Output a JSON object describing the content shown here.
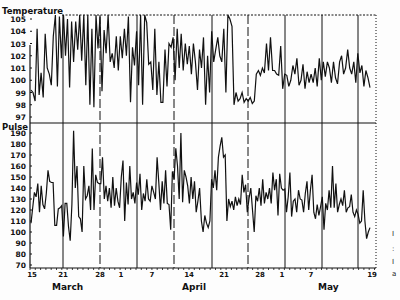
{
  "chart_data": [
    {
      "type": "line",
      "title": "Temperature",
      "ylabel": "Temperature",
      "ylim": [
        97,
        105
      ],
      "yticks": [
        97,
        98,
        99,
        100,
        101,
        102,
        103,
        104,
        105
      ],
      "grid": false,
      "x_labels": [
        "15",
        "21",
        "28",
        "1",
        "7",
        "14",
        "21",
        "28",
        "1",
        "7",
        "19"
      ],
      "months": [
        "March",
        "April",
        "May"
      ],
      "series": [
        {
          "name": "Temperature",
          "values": [
            99.2,
            99.0,
            98.3,
            104.2,
            98.8,
            100.6,
            98.6,
            103.8,
            101,
            100.5,
            99.6,
            103.6,
            105.4,
            99.5,
            105.2,
            101.8,
            105.4,
            102,
            105,
            99.4,
            104.8,
            101.5,
            104.8,
            102.5,
            105.4,
            101.6,
            105.4,
            99.6,
            105.4,
            98.0,
            104.2,
            97.8,
            105.4,
            102.6,
            105.2,
            99.1,
            104.1,
            102.2,
            105.4,
            101.5,
            102.2,
            101.0,
            103.6,
            100.8,
            103.6,
            101.8,
            104.2,
            102.0,
            105.2,
            98.2,
            102.7,
            101.2,
            104.0,
            99.6,
            105.4,
            98.0,
            105.4,
            104.7,
            101.3,
            101.5,
            99.2,
            104.2,
            98.8,
            101.5,
            98.2,
            98.2,
            102.5,
            99.5,
            103,
            102.7,
            103.5,
            100.0,
            104.2,
            101,
            103.8,
            100.8,
            103.0,
            101.3,
            102.8,
            100.5,
            103,
            101.5,
            99.2,
            102.5,
            101.0,
            103.5,
            98.0,
            102.0,
            99.0,
            104.0,
            101.5,
            102.5,
            103.5,
            102,
            101.5,
            104.2,
            99.0,
            105.4,
            105,
            104.4,
            98.0,
            99,
            98.3,
            98.5,
            99,
            98.2,
            98.5,
            98.3,
            98.6,
            98.1,
            98.3,
            100.5,
            100.8,
            100.4,
            101,
            100.6,
            103,
            100.8,
            103.5,
            100.8,
            100.8,
            100.5,
            100.4,
            102.8,
            99.3,
            100.5,
            100.4,
            99.5,
            100,
            101.2,
            100.5,
            101.8,
            99.6,
            100.0,
            101.3,
            99.3,
            100.7,
            99.8,
            100.5,
            99.8,
            101.0,
            99.5,
            101.8,
            100.0,
            101.5,
            100.3,
            101.5,
            101.0,
            99.8,
            101.5,
            100.2,
            99.7,
            101.5,
            102.0,
            100.5,
            101.0,
            102.5,
            101.0,
            100.5,
            101.5,
            99.8,
            102.2,
            100.6,
            101.2,
            99.5,
            100.8,
            100.2,
            99.4
          ]
        }
      ]
    },
    {
      "type": "line",
      "title": "Pulse",
      "ylabel": "Pulse",
      "ylim": [
        70,
        190
      ],
      "yticks": [
        70,
        80,
        90,
        100,
        110,
        120,
        130,
        140,
        150,
        160,
        170,
        180,
        190
      ],
      "grid": false,
      "x_labels": [
        "15",
        "21",
        "28",
        "1",
        "7",
        "14",
        "21",
        "28",
        "1",
        "7",
        "19"
      ],
      "months": [
        "March",
        "April",
        "May"
      ],
      "series": [
        {
          "name": "Pulse",
          "values": [
            108,
            122,
            136,
            132,
            144,
            118,
            142,
            125,
            121,
            135,
            156,
            146,
            145,
            145,
            106,
            106,
            121,
            122,
            124,
            96,
            126,
            126,
            105,
            92,
            125,
            192,
            140,
            160,
            114,
            112,
            100,
            160,
            130,
            133,
            142,
            120,
            176,
            120,
            152,
            145,
            144,
            144,
            168,
            130,
            142,
            128,
            140,
            122,
            150,
            124,
            140,
            128,
            122,
            150,
            165,
            110,
            145,
            125,
            160,
            130,
            136,
            126,
            145,
            134,
            153,
            120,
            135,
            128,
            148,
            130,
            128,
            142,
            136,
            130,
            168,
            145,
            120,
            146,
            126,
            156,
            126,
            125,
            102,
            155,
            148,
            176,
            160,
            130,
            190,
            127,
            156,
            150,
            142,
            126,
            150,
            130,
            146,
            118,
            128,
            140,
            110,
            100,
            115,
            108,
            104,
            110,
            148,
            140,
            156,
            138,
            168,
            178,
            186,
            168,
            170,
            110,
            130,
            123,
            128,
            120,
            132,
            124,
            130,
            125,
            152,
            136,
            143,
            118,
            131,
            140,
            120,
            100,
            133,
            128,
            140,
            124,
            148,
            126,
            136,
            130,
            140,
            126,
            154,
            138,
            148,
            115,
            153,
            140,
            138,
            139,
            118,
            132,
            154,
            114,
            128,
            130,
            118,
            138,
            130,
            129,
            118,
            135,
            146,
            120,
            138,
            152,
            118,
            112,
            125,
            115,
            123,
            132,
            102,
            126,
            120,
            138,
            122,
            160,
            122,
            144,
            118,
            125,
            130,
            124,
            138,
            118,
            122,
            123,
            134,
            118,
            114,
            120,
            116,
            108,
            110,
            138,
            110,
            94,
            100,
            104
          ]
        }
      ]
    }
  ],
  "labels": {
    "temperature_title": "Temperature",
    "pulse_title": "Pulse",
    "month_march": "March",
    "month_april": "April",
    "month_may": "May"
  }
}
